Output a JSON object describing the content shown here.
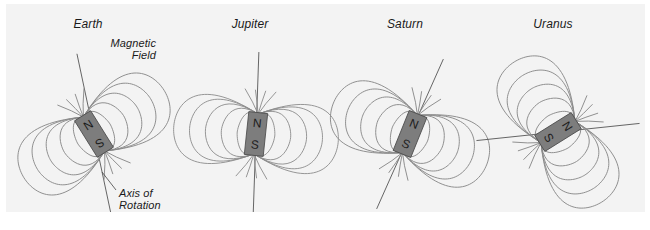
{
  "figure": {
    "background_color": "#f3f3f3",
    "page_color": "#ffffff",
    "line_color": "#8a8a8a",
    "magnet_color": "#7d7d7d",
    "text_color": "#1a1a1a"
  },
  "annotations": {
    "magnetic_field_line1": "Magnetic",
    "magnetic_field_line2": "Field",
    "axis_of_rotation_line1": "Axis of",
    "axis_of_rotation_line2": "Rotation"
  },
  "planets": [
    {
      "name": "Earth",
      "cx": 88,
      "cy": 130,
      "north_label": "N",
      "south_label": "S",
      "magnet_tilt_deg": 148,
      "axis_tilt_deg": 168,
      "north_on_top": false,
      "field_loops": 5
    },
    {
      "name": "Jupiter",
      "cx": 250,
      "cy": 130,
      "north_label": "N",
      "south_label": "S",
      "magnet_tilt_deg": 6,
      "axis_tilt_deg": 2,
      "north_on_top": true,
      "field_loops": 5
    },
    {
      "name": "Saturn",
      "cx": 404,
      "cy": 130,
      "north_label": "N",
      "south_label": "S",
      "magnet_tilt_deg": 22,
      "axis_tilt_deg": 24,
      "north_on_top": true,
      "field_loops": 5
    },
    {
      "name": "Uranus",
      "cx": 552,
      "cy": 128,
      "north_label": "N",
      "south_label": "S",
      "magnet_tilt_deg": 58,
      "axis_tilt_deg": 84,
      "north_on_top": true,
      "field_loops": 5
    }
  ]
}
